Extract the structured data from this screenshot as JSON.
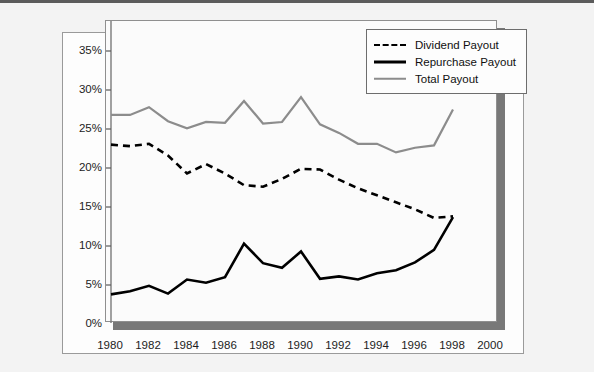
{
  "chart_data": {
    "type": "line",
    "title": "",
    "xlabel": "",
    "ylabel": "",
    "xlim": [
      1980,
      2000
    ],
    "ylim": [
      0,
      35
    ],
    "grid": false,
    "legend_position": "top-right",
    "x": [
      1980,
      1981,
      1982,
      1983,
      1984,
      1985,
      1986,
      1987,
      1988,
      1989,
      1990,
      1991,
      1992,
      1993,
      1994,
      1995,
      1996,
      1997,
      1998
    ],
    "xticks": [
      "1980",
      "1982",
      "1984",
      "1986",
      "1988",
      "1990",
      "1992",
      "1994",
      "1996",
      "1998",
      "2000"
    ],
    "xtick_values": [
      1980,
      1982,
      1984,
      1986,
      1988,
      1990,
      1992,
      1994,
      1996,
      1998,
      2000
    ],
    "yticks": [
      "0%",
      "5%",
      "10%",
      "15%",
      "20%",
      "25%",
      "30%",
      "35%"
    ],
    "ytick_values": [
      0,
      5,
      10,
      15,
      20,
      25,
      30,
      35
    ],
    "series": [
      {
        "name": "Dividend Payout",
        "style": "dashed",
        "color": "#000000",
        "values": [
          23.0,
          22.8,
          23.1,
          21.6,
          19.3,
          20.5,
          19.3,
          17.8,
          17.6,
          18.6,
          19.9,
          19.8,
          18.5,
          17.4,
          16.5,
          15.6,
          14.7,
          13.6,
          13.8
        ]
      },
      {
        "name": "Repurchase Payout",
        "style": "solid",
        "color": "#000000",
        "values": [
          3.8,
          4.2,
          4.9,
          3.9,
          5.7,
          5.3,
          6.0,
          10.3,
          7.8,
          7.2,
          9.3,
          5.8,
          6.1,
          5.7,
          6.5,
          6.9,
          7.9,
          9.5,
          13.7
        ]
      },
      {
        "name": "Total Payout",
        "style": "solid-gray",
        "color": "#8c8c8c",
        "values": [
          26.8,
          26.8,
          27.8,
          26.0,
          25.1,
          25.9,
          25.8,
          28.6,
          25.7,
          25.9,
          29.1,
          25.6,
          24.5,
          23.1,
          23.1,
          22.0,
          22.6,
          22.9,
          27.5
        ]
      }
    ]
  },
  "legend": {
    "items": [
      {
        "label": "Dividend Payout",
        "swatch": "dashed-line-icon"
      },
      {
        "label": "Repurchase Payout",
        "swatch": "solid-line-icon"
      },
      {
        "label": "Total Payout",
        "swatch": "gray-line-icon"
      }
    ]
  },
  "colors": {
    "dividend": "#000000",
    "repurchase": "#000000",
    "total": "#8c8c8c",
    "plot_background": "#fbfbfb",
    "page_background": "#f3f3f3",
    "shadow": "#787878",
    "axis": "#8f8f8f"
  }
}
